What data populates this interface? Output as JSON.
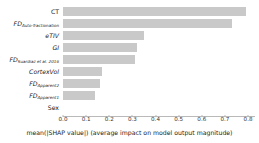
{
  "chart_data": {
    "type": "bar",
    "orientation": "horizontal",
    "title": "",
    "xlabel": "mean(|SHAP value|) (average impact on model output magnitude)",
    "ylabel": "",
    "xlim": [
      0.0,
      0.83
    ],
    "xticks": [
      "0.0",
      "0.1",
      "0.2",
      "0.3",
      "0.4",
      "0.5",
      "0.6",
      "0.7",
      "0.8"
    ],
    "xtick_values": [
      0.0,
      0.1,
      0.2,
      0.3,
      0.4,
      0.5,
      0.6,
      0.7,
      0.8
    ],
    "grid": false,
    "legend": false,
    "bar_color": "#c9c9c9",
    "background_color": "#ffffff",
    "categories": [
      "CT",
      "FD_Auto-fractionation",
      "eTIV",
      "GI",
      "FD_Suardiaz et al. 2016",
      "CortexVol",
      "FD_Apparent2",
      "FD_Apparent1",
      "Sex"
    ],
    "values": [
      0.79,
      0.73,
      0.35,
      0.32,
      0.31,
      0.17,
      0.16,
      0.14,
      0.0
    ],
    "bars": [
      {
        "base": "CT",
        "sub": "",
        "italic": false,
        "value": 0.79
      },
      {
        "base": "FD",
        "sub": "Auto-fractionation",
        "italic": true,
        "value": 0.73
      },
      {
        "base": "eTIV",
        "sub": "",
        "italic": true,
        "value": 0.35
      },
      {
        "base": "GI",
        "sub": "",
        "italic": true,
        "value": 0.32
      },
      {
        "base": "FD",
        "sub": "Suardiaz et al. 2016",
        "italic": true,
        "value": 0.31
      },
      {
        "base": "CortexVol",
        "sub": "",
        "italic": true,
        "value": 0.17
      },
      {
        "base": "FD",
        "sub": "Apparent2",
        "italic": true,
        "value": 0.16
      },
      {
        "base": "FD",
        "sub": "Apparent1",
        "italic": true,
        "value": 0.14
      },
      {
        "base": "Sex",
        "sub": "",
        "italic": false,
        "value": 0.0
      }
    ]
  }
}
